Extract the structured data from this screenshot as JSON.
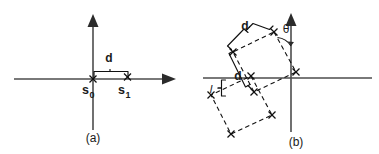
{
  "figure": {
    "background_color": "#ffffff",
    "ink_color": "#111111",
    "axis_color": "#4d4d4d",
    "width": 379,
    "height": 154,
    "panels": [
      {
        "id": "a",
        "caption": "(a)",
        "description": "2D cartesian axes with two sample points on the horizontal axis separated by distance d",
        "axes": {
          "origin": {
            "x": 93,
            "y": 79
          },
          "x_axis": {
            "x1": 14,
            "y1": 79,
            "x2": 168,
            "y2": 79,
            "arrow": "right"
          },
          "y_axis": {
            "x1": 93,
            "y1": 130,
            "x2": 93,
            "y2": 18,
            "arrow": "up"
          }
        },
        "points": [
          {
            "name": "s0",
            "label": "s",
            "subscript": "0",
            "x": 93,
            "y": 79,
            "marker": "x"
          },
          {
            "name": "s1",
            "label": "s",
            "subscript": "1",
            "x": 127,
            "y": 77,
            "marker": "x"
          }
        ],
        "measures": [
          {
            "name": "d",
            "label": "d",
            "from_x": 93,
            "to_x": 131,
            "y": 72,
            "label_x": 110,
            "label_y": 60
          }
        ]
      },
      {
        "id": "b",
        "caption": "(b)",
        "description": "2D cartesian axes with two dashed rotated squares of side d, offset by spacing l, rotated by angle theta from the vertical axis",
        "axes": {
          "origin": {
            "x": 291,
            "y": 78
          },
          "x_axis": {
            "x1": 203,
            "y1": 78,
            "x2": 372,
            "y2": 78,
            "arrow": "none"
          },
          "y_axis": {
            "x1": 291,
            "y1": 132,
            "x2": 291,
            "y2": 17,
            "arrow": "up"
          }
        },
        "rotation_deg": 28,
        "squares": [
          {
            "name": "upper-lattice-cell",
            "corners": [
              {
                "x": 274,
                "y": 32
              },
              {
                "x": 295,
                "y": 72
              },
              {
                "x": 255,
                "y": 92
              },
              {
                "x": 235,
                "y": 52
              }
            ]
          },
          {
            "name": "lower-lattice-cell",
            "corners": [
              {
                "x": 251,
                "y": 75
              },
              {
                "x": 272,
                "y": 114
              },
              {
                "x": 232,
                "y": 134
              },
              {
                "x": 212,
                "y": 95
              }
            ]
          }
        ],
        "measures": [
          {
            "name": "d-upper",
            "label": "d",
            "label_x": 243,
            "label_y": 37
          },
          {
            "name": "d-lower",
            "label": "d",
            "label_x": 238,
            "label_y": 79
          },
          {
            "name": "l-spacing",
            "label": "l",
            "label_x": 215,
            "label_y": 96
          },
          {
            "name": "theta-angle",
            "label": "θ",
            "label_x": 288,
            "label_y": 36
          }
        ]
      }
    ]
  },
  "captions": {
    "panel_a": "(a)",
    "panel_b": "(b)"
  },
  "labels": {
    "s_base": "s",
    "s0_sub": "0",
    "s1_sub": "1",
    "d": "d",
    "theta": "θ",
    "l": "l"
  }
}
